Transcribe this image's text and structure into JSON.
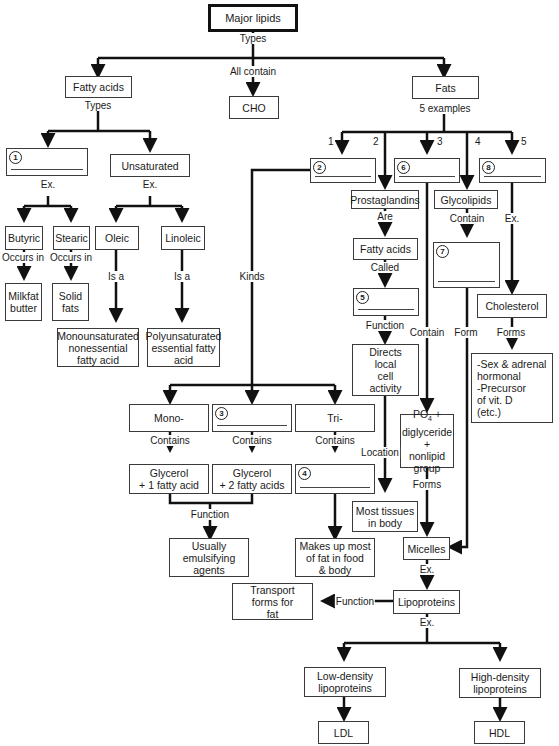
{
  "title": "Major lipids",
  "nodes": {
    "major_lipids": "Major lipids",
    "fatty_acids": "Fatty acids",
    "cho": "CHO",
    "fats": "Fats",
    "unsaturated": "Unsaturated",
    "butyric": "Butyric",
    "stearic": "Stearic",
    "oleic": "Oleic",
    "linoleic": "Linoleic",
    "milkfat": "Milkfat\nbutter",
    "solid_fats": "Solid\nfats",
    "mono_nonessential": "Monounsaturated\nnonessential\nfatty acid",
    "poly_essential": "Polyunsaturated\nessential fatty\nacid",
    "prostaglandins": "Prostaglandins",
    "glycolipids": "Glycolipids",
    "fatty_acids_2": "Fatty acids",
    "cholesterol": "Cholesterol",
    "directs": "Directs\nlocal\ncell\nactivity",
    "sex_hormones": "-Sex & adrenal\nhormonal\n-Precursor\nof vit. D\n(etc.)",
    "mono": "Mono-",
    "tri": "Tri-",
    "po4": "PO",
    "po4_sub": "4",
    "po4_rest": " +\ndiglyceride\n+\nnonlipid\ngroup",
    "glycerol1": "Glycerol\n+ 1 fatty acid",
    "glycerol2": "Glycerol\n+ 2 fatty acids",
    "most_tissues": "Most tissues\nin body",
    "emulsifying": "Usually\nemulsifying\nagents",
    "makes_up": "Makes up most\nof fat in food\n& body",
    "micelles": "Micelles",
    "transport": "Transport\nforms for\nfat",
    "lipoproteins": "Lipoproteins",
    "ldl_full": "Low-density\nlipoproteins",
    "hdl_full": "High-density\nlipoproteins",
    "ldl": "LDL",
    "hdl": "HDL"
  },
  "blanks": {
    "b1": "1",
    "b2": "2",
    "b3": "3",
    "b4": "4",
    "b5": "5",
    "b6": "6",
    "b7": "7",
    "b8": "8"
  },
  "labels": {
    "types": "Types",
    "all_contain": "All contain",
    "types_fa": "Types",
    "five_examples": "5 examples",
    "ex_1": "Ex.",
    "ex_unsat": "Ex.",
    "occurs_in_1": "Occurs in",
    "occurs_in_2": "Occurs in",
    "is_a_1": "Is a",
    "is_a_2": "Is a",
    "kinds": "Kinds",
    "are": "Are",
    "contain_gly": "Contain",
    "ex_8": "Ex.",
    "called": "Called",
    "function_5": "Function",
    "contain_6": "Contain",
    "form_7": "Form",
    "forms_chol": "Forms",
    "contains_mono": "Contains",
    "contains_3": "Contains",
    "contains_tri": "Contains",
    "location": "Location",
    "forms_po4": "Forms",
    "function_gly": "Function",
    "ex_micelles": "Ex.",
    "function_lipo": "Function",
    "ex_lipo": "Ex."
  },
  "branch_numbers": [
    "1",
    "2",
    "3",
    "4",
    "5"
  ]
}
